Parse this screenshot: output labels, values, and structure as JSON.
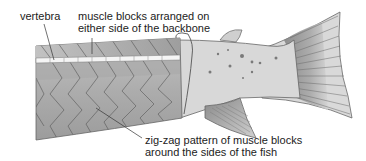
{
  "diagram": {
    "labels": {
      "vertebra": "vertebra",
      "muscle_blocks_line1": "muscle blocks arranged on",
      "muscle_blocks_line2": "either side of the backbone",
      "zigzag_line1": "zig-zag pattern of muscle blocks",
      "zigzag_line2": "around the sides of the fish"
    },
    "colors": {
      "background": "#ffffff",
      "skin": "#d6d6d6",
      "muscle_light": "#bdbdbd",
      "muscle_dark": "#9a9a9a",
      "vertebra": "#f4f4f4",
      "outline": "#555555",
      "fin_dark": "#8a8a8a",
      "text": "#222222"
    }
  }
}
